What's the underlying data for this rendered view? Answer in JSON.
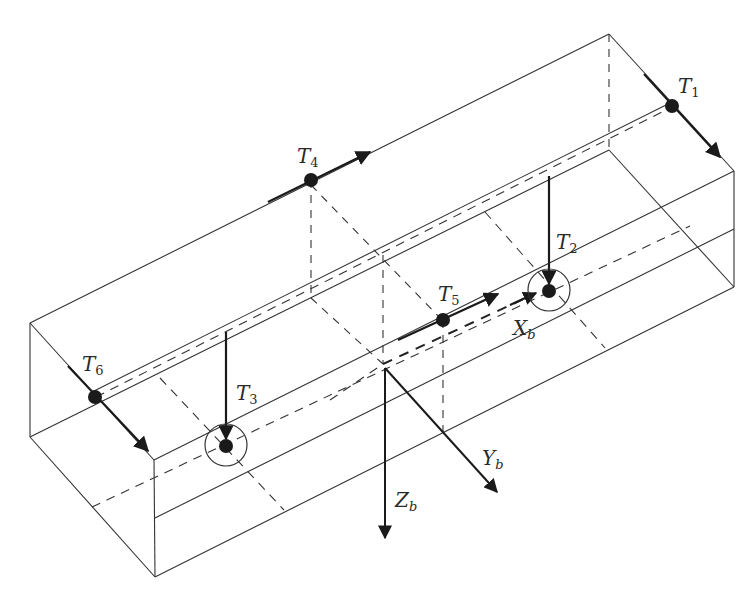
{
  "diagram": {
    "thrusters": [
      {
        "id": "T1",
        "main": "T",
        "sub": "1"
      },
      {
        "id": "T2",
        "main": "T",
        "sub": "2"
      },
      {
        "id": "T3",
        "main": "T",
        "sub": "3"
      },
      {
        "id": "T4",
        "main": "T",
        "sub": "4"
      },
      {
        "id": "T5",
        "main": "T",
        "sub": "5"
      },
      {
        "id": "T6",
        "main": "T",
        "sub": "6"
      }
    ],
    "axes": [
      {
        "id": "Xb",
        "main": "X",
        "sub": "b"
      },
      {
        "id": "Yb",
        "main": "Y",
        "sub": "b"
      },
      {
        "id": "Zb",
        "main": "Z",
        "sub": "b"
      }
    ],
    "colors": {
      "ink": "#1a1a1a",
      "background": "#ffffff"
    }
  }
}
